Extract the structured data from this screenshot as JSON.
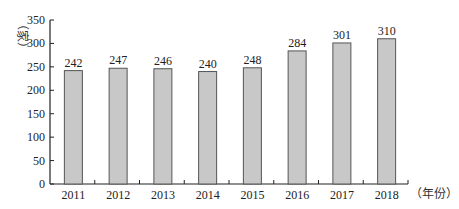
{
  "chart_data": {
    "type": "bar",
    "title": "",
    "xlabel": "（年份）",
    "ylabel": "（家）",
    "categories": [
      "2011",
      "2012",
      "2013",
      "2014",
      "2015",
      "2016",
      "2017",
      "2018"
    ],
    "values": [
      242,
      247,
      246,
      240,
      248,
      284,
      301,
      310
    ],
    "ylim": [
      0,
      350
    ],
    "yticks": [
      0,
      50,
      100,
      150,
      200,
      250,
      300,
      350
    ],
    "grid": false,
    "legend": "none",
    "bar_color": "#c8c8c8",
    "bar_edge_color": "#555555",
    "data_labels": true
  }
}
